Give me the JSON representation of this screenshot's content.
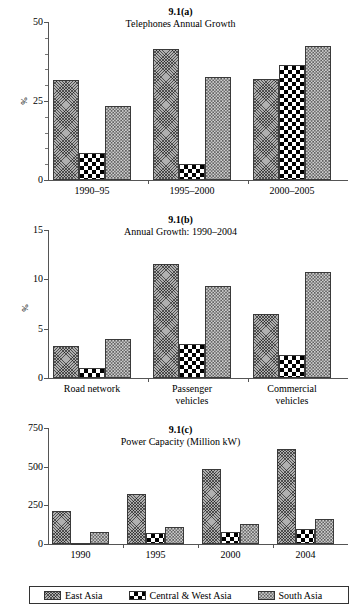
{
  "figure": {
    "series_names": [
      "East Asia",
      "Central & West Asia",
      "South Asia"
    ],
    "series_patterns": [
      "diagonal-crosshatch-grey",
      "black-white-checkerboard",
      "fine-grid-checker"
    ]
  },
  "legend": {
    "items": [
      {
        "label": "East Asia",
        "pattern": "pat-east"
      },
      {
        "label": "Central & West Asia",
        "pattern": "pat-central"
      },
      {
        "label": "South Asia",
        "pattern": "pat-south"
      }
    ]
  },
  "chart_data": [
    {
      "id": "a",
      "type": "bar",
      "number": "9.1(a)",
      "title": "Telephones Annual Growth",
      "xlabel": "",
      "ylabel": "%",
      "ylim": [
        0,
        50
      ],
      "yticks": [
        0,
        25,
        50
      ],
      "ytick_labels": [
        "0",
        "25",
        "50"
      ],
      "yminor_step": 5,
      "grid": false,
      "legend_position": "figure-bottom",
      "categories": [
        "1990–95",
        "1995–2000",
        "2000–2005"
      ],
      "series": [
        {
          "name": "East Asia",
          "values": [
            31.5,
            41.5,
            32.0
          ]
        },
        {
          "name": "Central & West Asia",
          "values": [
            8.5,
            5.0,
            36.5
          ]
        },
        {
          "name": "South Asia",
          "values": [
            23.5,
            32.5,
            42.5
          ]
        }
      ]
    },
    {
      "id": "b",
      "type": "bar",
      "number": "9.1(b)",
      "title": "Annual Growth: 1990–2004",
      "xlabel": "",
      "ylabel": "%",
      "ylim": [
        0,
        15
      ],
      "yticks": [
        0,
        5,
        10,
        15
      ],
      "ytick_labels": [
        "0",
        "5",
        "10",
        "15"
      ],
      "yminor_step": 0,
      "grid": false,
      "legend_position": "figure-bottom",
      "categories": [
        "Road network",
        "Passenger\nvehicles",
        "Commercial\nvehicles"
      ],
      "series": [
        {
          "name": "East Asia",
          "values": [
            3.2,
            11.6,
            6.5
          ]
        },
        {
          "name": "Central & West Asia",
          "values": [
            1.0,
            3.4,
            2.3
          ]
        },
        {
          "name": "South Asia",
          "values": [
            4.0,
            9.3,
            10.7
          ]
        }
      ]
    },
    {
      "id": "c",
      "type": "bar",
      "number": "9.1(c)",
      "title": "Power Capacity (Million kW)",
      "xlabel": "",
      "ylabel": "",
      "ylim": [
        0,
        750
      ],
      "yticks": [
        0,
        250,
        500,
        750
      ],
      "ytick_labels": [
        "0",
        "250",
        "500",
        "750"
      ],
      "yminor_step": 0,
      "grid": false,
      "legend_position": "figure-bottom",
      "categories": [
        "1990",
        "1995",
        "2000",
        "2004"
      ],
      "series": [
        {
          "name": "East Asia",
          "values": [
            215,
            325,
            485,
            615
          ]
        },
        {
          "name": "Central & West Asia",
          "values": [
            8,
            70,
            80,
            98
          ]
        },
        {
          "name": "South Asia",
          "values": [
            78,
            108,
            130,
            163
          ]
        }
      ]
    }
  ]
}
